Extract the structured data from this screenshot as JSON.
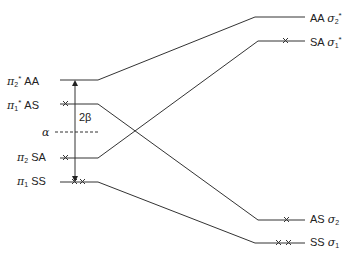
{
  "diagram": {
    "type": "orbital-correlation-diagram",
    "left_levels": [
      {
        "id": "pi2star",
        "symbol": "π",
        "sub": "2",
        "star": "*",
        "symmetry": "AA",
        "y": 80,
        "electrons": 0
      },
      {
        "id": "pi1star",
        "symbol": "π",
        "sub": "1",
        "star": "*",
        "symmetry": "AS",
        "y": 104,
        "electrons": 1
      },
      {
        "id": "pi2",
        "symbol": "π",
        "sub": "2",
        "star": "",
        "symmetry": "SA",
        "y": 158,
        "electrons": 1
      },
      {
        "id": "pi1",
        "symbol": "π",
        "sub": "1",
        "star": "",
        "symmetry": "SS",
        "y": 182,
        "electrons": 2
      }
    ],
    "right_levels": [
      {
        "id": "sigma2star",
        "symbol": "σ",
        "sub": "2",
        "star": "*",
        "symmetry": "AA",
        "y": 17,
        "electrons": 0
      },
      {
        "id": "sigma1star",
        "symbol": "σ",
        "sub": "1",
        "star": "*",
        "symmetry": "SA",
        "y": 41,
        "electrons": 1
      },
      {
        "id": "sigma2",
        "symbol": "σ",
        "sub": "2",
        "star": "",
        "symmetry": "AS",
        "y": 220,
        "electrons": 1
      },
      {
        "id": "sigma1",
        "symbol": "σ",
        "sub": "1",
        "star": "",
        "symmetry": "SS",
        "y": 243,
        "electrons": 2
      }
    ],
    "correlations": [
      {
        "from": "pi2star",
        "to": "sigma2star"
      },
      {
        "from": "pi1star",
        "to": "sigma2"
      },
      {
        "from": "pi2",
        "to": "sigma1star"
      },
      {
        "from": "pi1",
        "to": "sigma1"
      }
    ],
    "reference_level": {
      "label": "α",
      "y": 132
    },
    "gap_arrow": {
      "label": "2β"
    },
    "labels": {
      "pi2star_sym": "AA",
      "pi1star_sym": "AS",
      "pi2_sym": "SA",
      "pi1_sym": "SS",
      "sigma2star_sym": "AA",
      "sigma1star_sym": "SA",
      "sigma2_sym": "AS",
      "sigma1_sym": "SS",
      "pi": "π",
      "sigma": "σ",
      "star": "*",
      "sub1": "1",
      "sub2": "2",
      "alpha": "α",
      "two_beta": "2β"
    }
  }
}
